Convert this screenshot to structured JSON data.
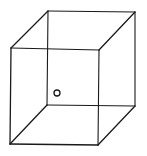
{
  "diagram": {
    "type": "wireframe-cube",
    "background": "#ffffff",
    "stroke_color": "#1a1a1a",
    "vertices": {
      "front_top_left": [
        11,
        48
      ],
      "front_top_right": [
        99,
        50
      ],
      "front_bottom_left": [
        10,
        144
      ],
      "front_bottom_right": [
        98,
        145
      ],
      "back_top_left": [
        48,
        11
      ],
      "back_top_right": [
        135,
        12
      ],
      "back_bottom_left": [
        47,
        105
      ],
      "back_bottom_right": [
        135,
        106
      ]
    },
    "marker": {
      "shape": "circle",
      "center": [
        57,
        93
      ],
      "radius": 3
    }
  }
}
